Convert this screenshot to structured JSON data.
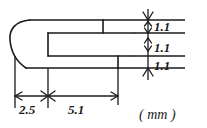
{
  "drawing": {
    "title": "u-shaped-profile-cross-section",
    "unit_label": "( mm )",
    "line_color": "#1a1a1a",
    "background_color": "#ffffff",
    "vertical_dimensions": [
      {
        "id": "top-wall-thickness",
        "value": "1.1"
      },
      {
        "id": "slot-gap",
        "value": "1.1"
      },
      {
        "id": "bottom-wall-thickness",
        "value": "1.1"
      }
    ],
    "horizontal_dimensions": [
      {
        "id": "left-radius-section",
        "value": "2.5"
      },
      {
        "id": "straight-section",
        "value": "5.1"
      }
    ]
  }
}
